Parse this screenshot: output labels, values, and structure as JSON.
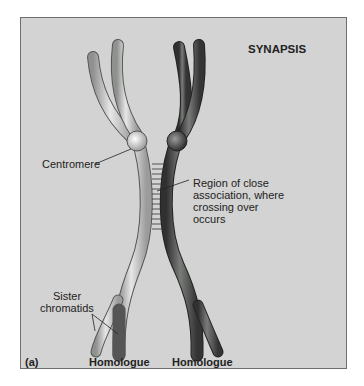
{
  "figure": {
    "title": "SYNAPSIS",
    "panel_label": "(a)",
    "labels": {
      "centromere": "Centromere",
      "region_line1": "Region of close",
      "region_line2": "association, where",
      "region_line3": "crossing over",
      "region_line4": "occurs",
      "sister_line1": "Sister",
      "sister_line2": "chromatids",
      "homologue_left": "Homologue",
      "homologue_right": "Homologue"
    },
    "colors": {
      "background": "#d2d3d2",
      "light_homologue": "#c9cbc9",
      "dark_homologue": "#4d4f4d",
      "outline": "#555555"
    }
  }
}
